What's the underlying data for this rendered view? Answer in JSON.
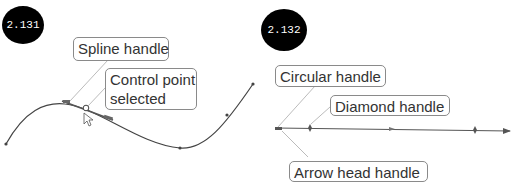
{
  "figures": [
    {
      "badge": "2.131",
      "callouts": [
        {
          "label": "Spline handle"
        },
        {
          "label_line1": "Control point",
          "label_line2": "selected"
        }
      ]
    },
    {
      "badge": "2.132",
      "callouts": [
        {
          "label": "Circular handle"
        },
        {
          "label": "Diamond handle"
        },
        {
          "label": "Arrow head handle"
        }
      ]
    }
  ],
  "colors": {
    "badge_bg": "#000000",
    "badge_text": "#ffffff",
    "curve": "#444444",
    "leader": "#aaaaaa",
    "callout_border": "#8a8a8a"
  }
}
